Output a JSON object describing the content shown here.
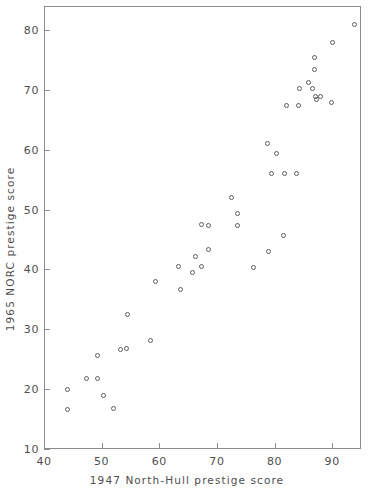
{
  "chart_data": {
    "type": "scatter",
    "title": "",
    "xlabel": "1947 North-Hull prestige score",
    "ylabel": "1965 NORC prestige score",
    "xlim": [
      40,
      95
    ],
    "ylim": [
      10,
      84
    ],
    "xticks": [
      40,
      50,
      60,
      70,
      80,
      90
    ],
    "yticks": [
      10,
      20,
      30,
      40,
      50,
      60,
      70,
      80
    ],
    "grid": false,
    "legend": null,
    "marker": "open-circle",
    "series": [
      {
        "name": "occupations",
        "points": [
          [
            44.0,
            20.0
          ],
          [
            44.1,
            16.6
          ],
          [
            47.3,
            21.8
          ],
          [
            49.2,
            25.6
          ],
          [
            49.3,
            21.7
          ],
          [
            50.3,
            19.0
          ],
          [
            52.1,
            16.8
          ],
          [
            53.3,
            26.6
          ],
          [
            54.3,
            26.8
          ],
          [
            54.5,
            32.4
          ],
          [
            58.4,
            28.1
          ],
          [
            59.4,
            37.9
          ],
          [
            63.4,
            40.5
          ],
          [
            63.6,
            36.6
          ],
          [
            65.8,
            39.5
          ],
          [
            66.2,
            42.2
          ],
          [
            67.3,
            47.5
          ],
          [
            67.4,
            40.5
          ],
          [
            68.5,
            47.4
          ],
          [
            68.6,
            43.4
          ],
          [
            72.6,
            52.0
          ],
          [
            73.5,
            49.4
          ],
          [
            73.6,
            47.4
          ],
          [
            76.4,
            40.3
          ],
          [
            78.8,
            61.1
          ],
          [
            79.0,
            43.0
          ],
          [
            79.4,
            56.1
          ],
          [
            80.3,
            59.3
          ],
          [
            81.6,
            45.7
          ],
          [
            81.8,
            56.1
          ],
          [
            82.0,
            67.3
          ],
          [
            83.8,
            56.1
          ],
          [
            84.1,
            67.4
          ],
          [
            84.3,
            70.3
          ],
          [
            85.9,
            71.2
          ],
          [
            86.6,
            70.3
          ],
          [
            86.9,
            75.4
          ],
          [
            87.0,
            73.4
          ],
          [
            87.1,
            68.9
          ],
          [
            87.2,
            68.3
          ],
          [
            88.0,
            68.8
          ],
          [
            89.8,
            67.9
          ],
          [
            90.1,
            77.9
          ],
          [
            93.8,
            80.9
          ]
        ]
      }
    ],
    "n_points": 44,
    "axis_color": "#8d8d8d",
    "marker_color": "#5c5c61",
    "background": "#ffffff"
  }
}
